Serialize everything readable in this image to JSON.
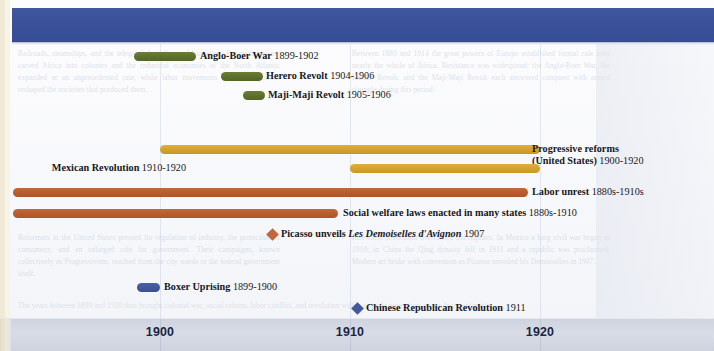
{
  "figure": {
    "kind": "timeline",
    "era": "1900-1920",
    "header_band_color": "#3a5199",
    "axis_band_color": "#d3d8e3"
  },
  "chart_data": {
    "type": "timeline",
    "title": "",
    "xlabel": "",
    "ylabel": "",
    "xlim": [
      1896,
      1924
    ],
    "grid": true,
    "legend": "none",
    "axis_ticks": [
      {
        "label": "1900",
        "value": 1900,
        "x": 160
      },
      {
        "label": "1910",
        "value": 1910,
        "x": 350
      },
      {
        "label": "1920",
        "value": 1920,
        "x": 540
      }
    ],
    "colors": {
      "green": "#5d6f2b",
      "gold": "#d2a12e",
      "rust": "#b85c2f",
      "blue": "#41569b"
    },
    "events": [
      {
        "name": "Anglo-Boer War",
        "years": "1899-1902",
        "start": 1899,
        "end": 1902,
        "marker": "bar",
        "color": "green",
        "label_side": "right",
        "row": 0,
        "bar_x": 134,
        "bar_w": 62,
        "label_x": 200,
        "y": 52
      },
      {
        "name": "Herero Revolt",
        "years": "1904-1906",
        "start": 1904,
        "end": 1906,
        "marker": "bar",
        "color": "green",
        "label_side": "right",
        "row": 1,
        "bar_x": 221,
        "bar_w": 42,
        "label_x": 266,
        "y": 72
      },
      {
        "name": "Maji-Maji Revolt",
        "years": "1905-1906",
        "start": 1905,
        "end": 1906,
        "marker": "bar",
        "color": "green",
        "label_side": "right",
        "row": 2,
        "bar_x": 243,
        "bar_w": 22,
        "label_x": 268,
        "y": 91
      },
      {
        "name": "Progressive reforms",
        "name_line2": "(United States)",
        "years": "1900-1920",
        "start": 1900,
        "end": 1920,
        "marker": "bar",
        "color": "gold",
        "label_side": "right",
        "row": 5,
        "bar_x": 160,
        "bar_w": 380,
        "label_x": 532,
        "y": 145
      },
      {
        "name": "Mexican Revolution",
        "years": "1910-1920",
        "start": 1910,
        "end": 1920,
        "marker": "bar",
        "color": "gold",
        "label_side": "left",
        "row": 6,
        "bar_x": 350,
        "bar_w": 190,
        "label_x": 186,
        "y": 164
      },
      {
        "name": "Labor unrest",
        "years": "1880s-1910s",
        "start": 1880,
        "end": 1919,
        "marker": "bar",
        "color": "rust",
        "label_side": "right",
        "row": 7,
        "bar_x": 13,
        "bar_w": 515,
        "label_x": 532,
        "y": 188
      },
      {
        "name": "Social welfare laws enacted in many states",
        "years": "1880s-1910",
        "start": 1880,
        "end": 1910,
        "marker": "bar",
        "color": "rust",
        "label_side": "right",
        "row": 8,
        "bar_x": 13,
        "bar_w": 325,
        "label_x": 343,
        "y": 209
      },
      {
        "name": "Picasso unveils",
        "title_italic": "Les Demoiselles d'Avignon",
        "years": "1907",
        "start": 1907,
        "end": 1907,
        "marker": "diamond",
        "color": "rust",
        "label_side": "right",
        "row": 9,
        "marker_x": 268,
        "label_x": 281,
        "y": 230
      },
      {
        "name": "Boxer Uprising",
        "years": "1899-1900",
        "start": 1899,
        "end": 1900,
        "marker": "bar",
        "color": "blue",
        "label_side": "right",
        "row": 11,
        "bar_x": 137,
        "bar_w": 23,
        "label_x": 164,
        "y": 283
      },
      {
        "name": "Chinese Republican Revolution",
        "years": "1911",
        "start": 1911,
        "end": 1911,
        "marker": "diamond",
        "color": "blue",
        "label_side": "right",
        "row": 12,
        "marker_x": 353,
        "label_x": 366,
        "y": 304
      }
    ],
    "gridlines_x": [
      160,
      350,
      540
    ]
  },
  "background_text": {
    "left": "Railroads, steamships, and the telegraph knit the world together. European powers carved Africa into colonies and the industrial economies of the North Atlantic expanded at an unprecedented rate, while labor movements and mass politics reshaped the societies that produced them.",
    "right": "Between 1880 and 1914 the great powers of Europe established formal rule over nearly the whole of Africa. Resistance was widespread: the Anglo-Boer War, the Herero Revolt, and the Maji-Maji Revolt each answered conquest with armed struggle during this period.",
    "left2": "Reformers in the United States pressed for regulation of industry, the protection of consumers, and an enlarged role for government. Their campaigns, known collectively as Progressivism, reached from the city wards to the federal government itself.",
    "right2": "Elsewhere revolution overturned old regimes. In Mexico a long civil war began in 1910; in China the Qing dynasty fell in 1911 and a republic was proclaimed. Modern art broke with convention as Picasso unveiled his Demoiselles in 1907.",
    "bottom": "The years between 1899 and 1920 thus brought colonial war, social reform, labor conflict, and revolution within a single generation across four continents."
  }
}
